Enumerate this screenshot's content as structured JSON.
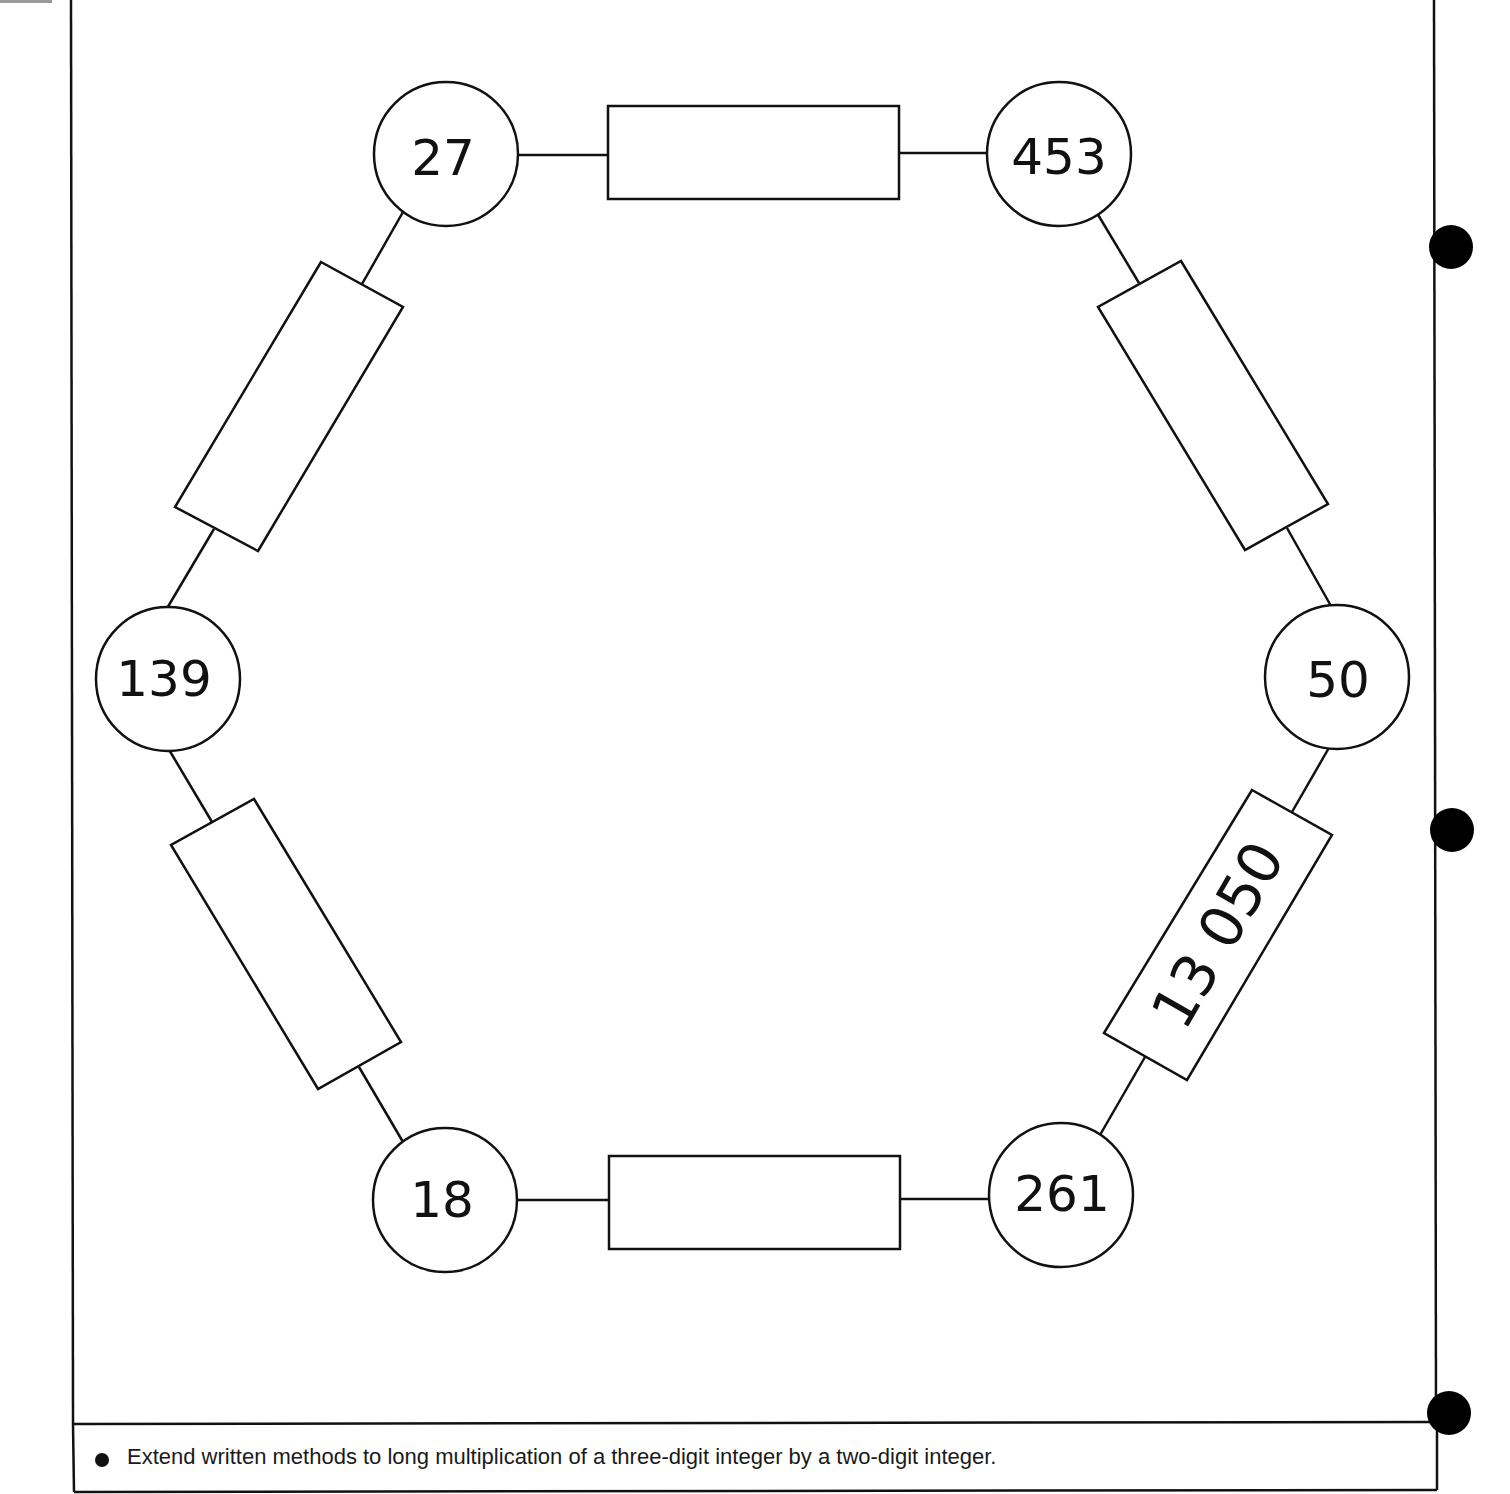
{
  "worksheet": {
    "nodes": [
      {
        "id": "n27",
        "label": "27",
        "cx": 446,
        "cy": 154
      },
      {
        "id": "n453",
        "label": "453",
        "cx": 1059,
        "cy": 154
      },
      {
        "id": "n50",
        "label": "50",
        "cx": 1337,
        "cy": 677
      },
      {
        "id": "n261",
        "label": "261",
        "cx": 1061,
        "cy": 1195
      },
      {
        "id": "n18",
        "label": "18",
        "cx": 445,
        "cy": 1200
      },
      {
        "id": "n139",
        "label": "139",
        "cx": 168,
        "cy": 679
      }
    ],
    "answer_boxes": [
      {
        "id": "box-27-453",
        "between": [
          "27",
          "453"
        ],
        "value": ""
      },
      {
        "id": "box-453-50",
        "between": [
          "453",
          "50"
        ],
        "value": ""
      },
      {
        "id": "box-50-261",
        "between": [
          "50",
          "261"
        ],
        "value": "13 050"
      },
      {
        "id": "box-261-18",
        "between": [
          "261",
          "18"
        ],
        "value": ""
      },
      {
        "id": "box-18-139",
        "between": [
          "18",
          "139"
        ],
        "value": ""
      },
      {
        "id": "box-139-27",
        "between": [
          "139",
          "27"
        ],
        "value": ""
      }
    ],
    "footer": {
      "objective": "Extend written methods to long multiplication of a three-digit integer by a two-digit integer."
    },
    "colors": {
      "ink": "#111111",
      "paper": "#ffffff"
    }
  }
}
